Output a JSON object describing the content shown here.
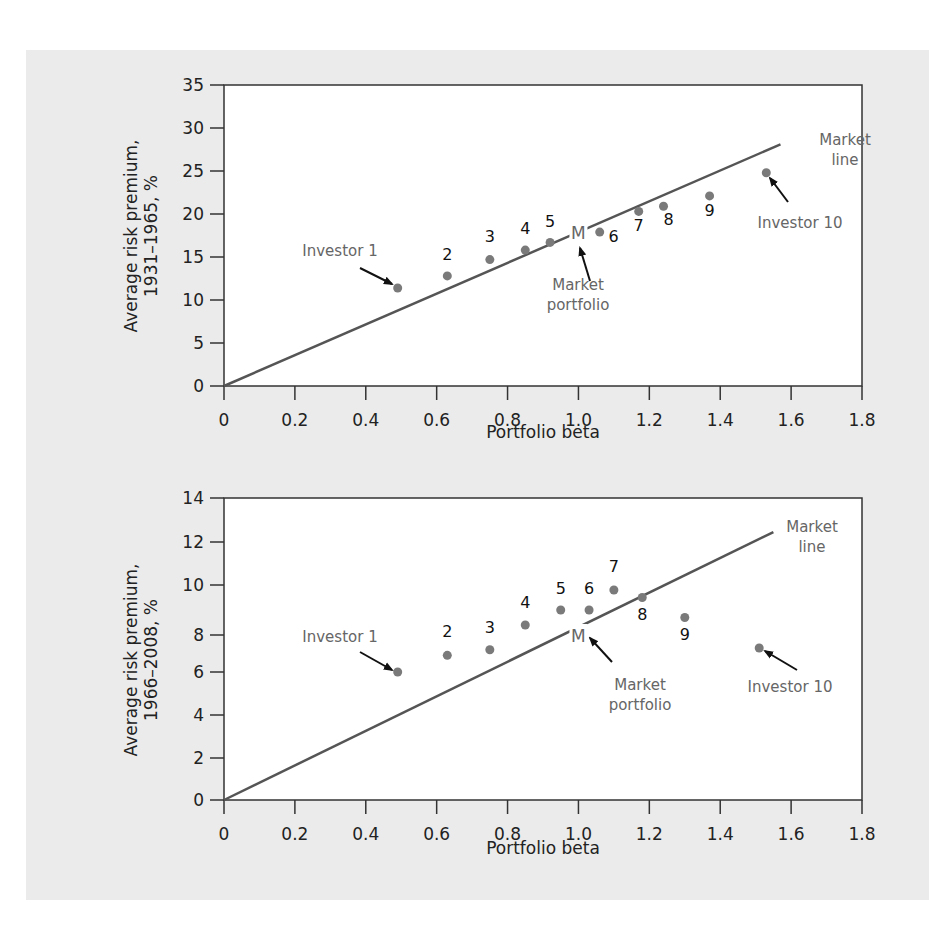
{
  "chart_data": [
    {
      "type": "scatter",
      "title": "",
      "xlabel": "Portfolio beta",
      "ylabel": "Average risk premium, 1931–1965, %",
      "ylabel_lines": [
        "Average risk premium,",
        "1931–1965, %"
      ],
      "xlim": [
        0,
        1.8
      ],
      "ylim": [
        0,
        35
      ],
      "x_ticks": [
        "0",
        "0.2",
        "0.4",
        "0.6",
        "0.8",
        "1.0",
        "1.2",
        "1.4",
        "1.6",
        "1.8"
      ],
      "y_ticks": [
        "0",
        "5",
        "10",
        "15",
        "20",
        "25",
        "30",
        "35"
      ],
      "grid": false,
      "market_line": {
        "label_lines": [
          "Market",
          "line"
        ],
        "x": [
          0,
          1.57
        ],
        "y": [
          0,
          28.1
        ]
      },
      "market_portfolio": {
        "marker": "M",
        "label_lines": [
          "Market",
          "portfolio"
        ],
        "x": 1.0,
        "y": 17.9
      },
      "points": [
        {
          "label": "Investor 1",
          "x": 0.49,
          "y": 11.4
        },
        {
          "label": "2",
          "x": 0.63,
          "y": 12.8
        },
        {
          "label": "3",
          "x": 0.75,
          "y": 14.7
        },
        {
          "label": "4",
          "x": 0.85,
          "y": 15.8
        },
        {
          "label": "5",
          "x": 0.92,
          "y": 16.7
        },
        {
          "label": "6",
          "x": 1.06,
          "y": 17.9
        },
        {
          "label": "7",
          "x": 1.17,
          "y": 20.3
        },
        {
          "label": "8",
          "x": 1.24,
          "y": 20.9
        },
        {
          "label": "9",
          "x": 1.37,
          "y": 22.1
        },
        {
          "label": "Investor 10",
          "x": 1.53,
          "y": 24.8
        }
      ]
    },
    {
      "type": "scatter",
      "title": "",
      "xlabel": "Portfolio beta",
      "ylabel": "Average risk premium, 1966–2008, %",
      "ylabel_lines": [
        "Average risk premium,",
        "1966–2008, %"
      ],
      "xlim": [
        0,
        1.8
      ],
      "ylim": [
        0,
        14
      ],
      "x_ticks": [
        "0",
        "0.2",
        "0.4",
        "0.6",
        "0.8",
        "1.0",
        "1.2",
        "1.4",
        "1.6",
        "1.8"
      ],
      "y_ticks": [
        "0",
        "2",
        "4",
        "6",
        "8",
        "10",
        "12",
        "14"
      ],
      "grid": false,
      "market_line": {
        "label_lines": [
          "Market",
          "line"
        ],
        "x": [
          0,
          1.55
        ],
        "y": [
          0,
          12.45
        ]
      },
      "market_portfolio": {
        "marker": "M",
        "label_lines": [
          "Market",
          "portfolio"
        ],
        "x": 1.0,
        "y": 8.0
      },
      "points": [
        {
          "label": "Investor 1",
          "x": 0.49,
          "y": 6.0
        },
        {
          "label": "2",
          "x": 0.63,
          "y": 6.9
        },
        {
          "label": "3",
          "x": 0.75,
          "y": 7.2
        },
        {
          "label": "4",
          "x": 0.85,
          "y": 8.4
        },
        {
          "label": "5",
          "x": 0.95,
          "y": 9.0
        },
        {
          "label": "6",
          "x": 1.03,
          "y": 9.0
        },
        {
          "label": "7",
          "x": 1.1,
          "y": 9.8
        },
        {
          "label": "8",
          "x": 1.18,
          "y": 9.5
        },
        {
          "label": "9",
          "x": 1.3,
          "y": 8.7
        },
        {
          "label": "Investor 10",
          "x": 1.51,
          "y": 7.3
        }
      ]
    }
  ],
  "colors": {
    "panel_bg": "#ebebeb",
    "plot_bg": "#ffffff",
    "axis": "#333333",
    "market_line": "#555555",
    "dot": "#7a7a7a",
    "annotation_text": "#666666",
    "arrow": "#111111"
  }
}
